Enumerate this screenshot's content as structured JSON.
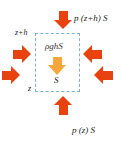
{
  "figure": {
    "type": "hydrostatic-pressure-force-balance-diagram",
    "background_color": "#ffffff"
  },
  "colors": {
    "pressure_arrow": "#E8430E",
    "weight_arrow": "#F7A83C",
    "control_volume_border": "#7FB2D9",
    "text": "#231F20"
  },
  "control_volume": {
    "name": "fluid-element",
    "border_style": "dashed",
    "area_label": "S"
  },
  "labels": {
    "top_force": "p (z+h) S",
    "bottom_force": "p (z) S",
    "top_height": "z+h",
    "bottom_height": "z",
    "weight": "ρghS",
    "area": "S"
  },
  "arrows": [
    {
      "name": "top-pressure-arrow",
      "direction": "down",
      "color": "#E8430E"
    },
    {
      "name": "bottom-pressure-arrow",
      "direction": "up",
      "color": "#E8430E"
    },
    {
      "name": "left-upper-pressure-arrow",
      "direction": "right",
      "color": "#E8430E"
    },
    {
      "name": "left-lower-pressure-arrow",
      "direction": "right",
      "color": "#E8430E"
    },
    {
      "name": "right-upper-pressure-arrow",
      "direction": "left",
      "color": "#E8430E"
    },
    {
      "name": "right-lower-pressure-arrow",
      "direction": "left",
      "color": "#E8430E"
    },
    {
      "name": "weight-arrow",
      "direction": "down",
      "color": "#F7A83C"
    }
  ]
}
